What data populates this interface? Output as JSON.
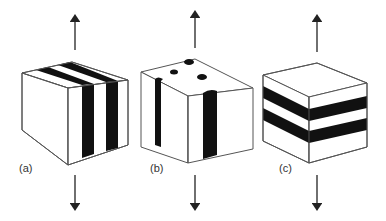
{
  "figure": {
    "panels": [
      {
        "id": "a",
        "label": "(a)",
        "description": "cube with vertical stripes parallel to stress axis on front and top faces"
      },
      {
        "id": "b",
        "label": "(b)",
        "description": "cube with vertical rods (cylinders) parallel to stress axis"
      },
      {
        "id": "c",
        "label": "(c)",
        "description": "cube with horizontal layers perpendicular to stress axis"
      }
    ],
    "arrows": "vertical stress arrows pointing up above and down below each cube",
    "colors": {
      "stripe": "#111111",
      "outline": "#555555",
      "background": "#ffffff"
    }
  }
}
